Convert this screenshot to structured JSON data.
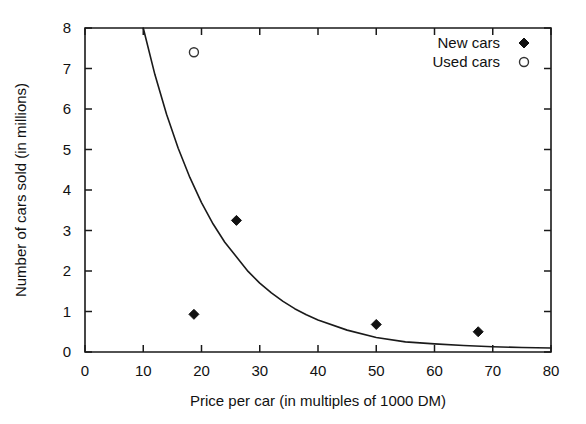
{
  "chart_data": {
    "type": "scatter",
    "title": "",
    "xlabel": "Price per car (in multiples of 1000 DM)",
    "ylabel": "Number of cars sold (in millions)",
    "xlim": [
      0,
      80
    ],
    "ylim": [
      0,
      8
    ],
    "xticks": [
      0,
      10,
      20,
      30,
      40,
      50,
      60,
      70,
      80
    ],
    "yticks": [
      0,
      1,
      2,
      3,
      4,
      5,
      6,
      7,
      8
    ],
    "xtick_labels": [
      "0",
      "10",
      "20",
      "30",
      "40",
      "50",
      "60",
      "70",
      "80"
    ],
    "ytick_labels": [
      "0",
      "1",
      "2",
      "3",
      "4",
      "5",
      "6",
      "7",
      "8"
    ],
    "grid": false,
    "legend_position": "top-right",
    "series": [
      {
        "name": "New cars",
        "marker": "filled-diamond",
        "color": "#111111",
        "points": [
          {
            "x": 18.7,
            "y": 0.93
          },
          {
            "x": 26.0,
            "y": 3.25
          },
          {
            "x": 50.0,
            "y": 0.68
          },
          {
            "x": 67.5,
            "y": 0.5
          }
        ]
      },
      {
        "name": "Used cars",
        "marker": "open-circle",
        "color": "#333333",
        "points": [
          {
            "x": 18.7,
            "y": 7.4
          }
        ]
      }
    ],
    "fit_curve": {
      "name": "exponential decay fit",
      "color": "#1a1a1a",
      "points": [
        {
          "x": 10.0,
          "y": 8.0
        },
        {
          "x": 12.0,
          "y": 6.85
        },
        {
          "x": 14.0,
          "y": 5.87
        },
        {
          "x": 16.0,
          "y": 5.03
        },
        {
          "x": 18.0,
          "y": 4.31
        },
        {
          "x": 20.0,
          "y": 3.69
        },
        {
          "x": 22.0,
          "y": 3.16
        },
        {
          "x": 24.0,
          "y": 2.71
        },
        {
          "x": 26.0,
          "y": 3.25
        },
        {
          "x": 28.0,
          "y": 1.99
        },
        {
          "x": 30.0,
          "y": 1.7
        },
        {
          "x": 32.0,
          "y": 1.46
        },
        {
          "x": 34.0,
          "y": 1.25
        },
        {
          "x": 36.0,
          "y": 1.07
        },
        {
          "x": 38.0,
          "y": 0.92
        },
        {
          "x": 40.0,
          "y": 0.79
        },
        {
          "x": 45.0,
          "y": 0.54
        },
        {
          "x": 50.0,
          "y": 0.36
        },
        {
          "x": 55.0,
          "y": 0.25
        },
        {
          "x": 60.0,
          "y": 0.2
        },
        {
          "x": 65.0,
          "y": 0.16
        },
        {
          "x": 70.0,
          "y": 0.13
        },
        {
          "x": 75.0,
          "y": 0.11
        },
        {
          "x": 80.0,
          "y": 0.1
        }
      ]
    },
    "legend": [
      {
        "label": "New cars",
        "marker": "filled-diamond"
      },
      {
        "label": "Used cars",
        "marker": "open-circle"
      }
    ]
  }
}
